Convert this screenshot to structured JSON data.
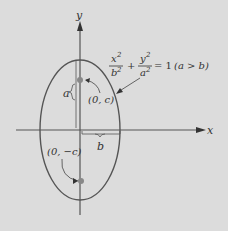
{
  "figure": {
    "background": "#dcdcdc",
    "curve_color": "#555555",
    "point_color": "#888888",
    "axis_labels": {
      "x": "x",
      "y": "y"
    },
    "equation": {
      "x_num": "x",
      "x_den": "b",
      "y_num": "y",
      "y_den": "a",
      "exp": "2",
      "rhs": "= 1",
      "condition": "(a > b)"
    },
    "labels": {
      "a": "a",
      "b": "b",
      "focus_top": "(0, c)",
      "focus_bottom": "(0, −c)"
    }
  }
}
